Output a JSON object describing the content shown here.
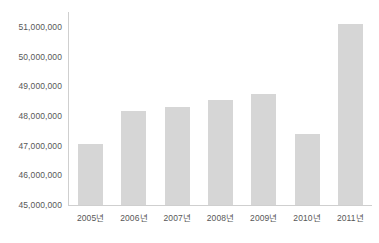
{
  "chart_data": {
    "type": "bar",
    "title": "",
    "subtitle": "",
    "xlabel": "",
    "ylabel": "",
    "categories": [
      "2005년",
      "2006년",
      "2007년",
      "2008년",
      "2009년",
      "2010년",
      "2011년"
    ],
    "values": [
      47050000,
      48150000,
      48300000,
      48550000,
      48750000,
      47400000,
      51100000
    ],
    "ylim": [
      45000000,
      51500000
    ],
    "y_ticks": [
      45000000,
      46000000,
      47000000,
      48000000,
      49000000,
      50000000,
      51000000
    ],
    "y_tick_labels": [
      "45,000,000",
      "46,000,000",
      "47,000,000",
      "48,000,000",
      "49,000,000",
      "50,000,000",
      "51,000,000"
    ],
    "grid": false,
    "legend": null,
    "legend_position": "none",
    "series": [
      {
        "name": "",
        "values": [
          47050000,
          48150000,
          48300000,
          48550000,
          48750000,
          47400000,
          51100000
        ]
      }
    ],
    "colors": {
      "bar_fill": "#d6d6d6",
      "axis_line": "#cfcfcf",
      "tick_label": "#575757",
      "background": "#ffffff"
    }
  }
}
